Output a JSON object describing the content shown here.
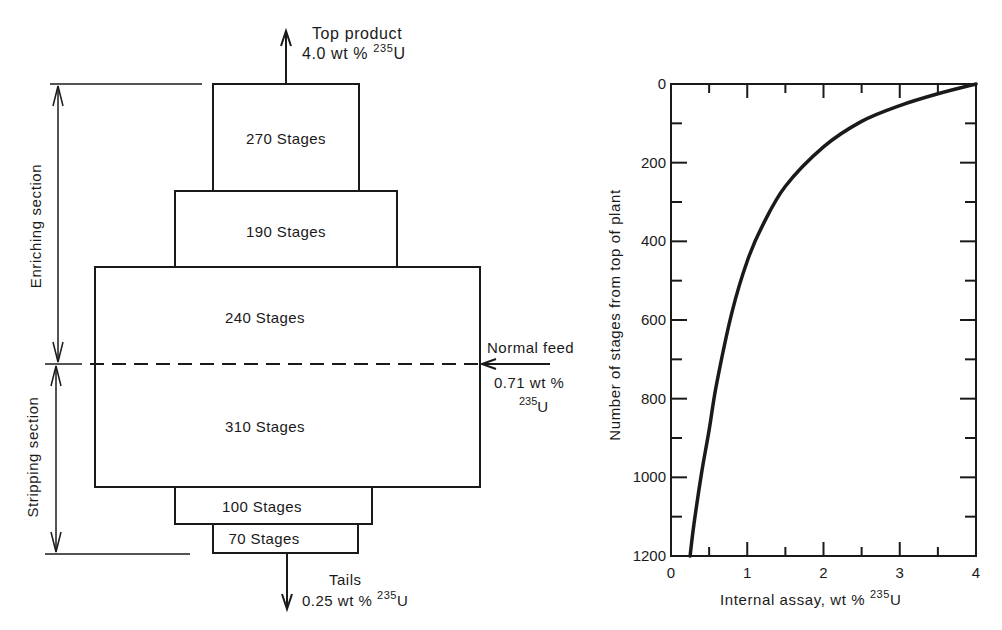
{
  "cascade": {
    "top_product": {
      "label": "Top product",
      "assay_value": "4.0 wt % ",
      "isotope_mass": "235",
      "isotope_symbol": "U"
    },
    "tails": {
      "label": "Tails",
      "assay_value": "0.25 wt % ",
      "isotope_mass": "235",
      "isotope_symbol": "U"
    },
    "normal_feed": {
      "label": "Normal feed",
      "assay_value": "0.71 wt %",
      "isotope_mass": "235",
      "isotope_symbol": "U"
    },
    "sections": [
      {
        "label": "Enriching section"
      },
      {
        "label": "Stripping section"
      }
    ],
    "blocks": [
      {
        "label": "270 Stages",
        "stages": 270
      },
      {
        "label": "190 Stages",
        "stages": 190
      },
      {
        "label": "240 Stages",
        "stages": 240
      },
      {
        "label": "310 Stages",
        "stages": 310
      },
      {
        "label": "100 Stages",
        "stages": 100
      },
      {
        "label": "70 Stages",
        "stages": 70
      }
    ]
  },
  "chart_data": {
    "type": "line",
    "title": "",
    "xlabel": "Internal assay, wt % 235U",
    "xlabel_text": "Internal assay, wt % ",
    "xlabel_isotope_mass": "235",
    "xlabel_isotope_symbol": "U",
    "ylabel": "Number of stages from top of plant",
    "xlim": [
      0,
      4
    ],
    "ylim": [
      1200,
      0
    ],
    "y_inverted": true,
    "grid": false,
    "x_ticks": [
      "0",
      "1",
      "2",
      "3",
      "4"
    ],
    "y_ticks": [
      "0",
      "200",
      "400",
      "600",
      "800",
      "1000",
      "1200"
    ],
    "series": [
      {
        "name": "Internal assay profile",
        "x": [
          4.0,
          3.5,
          3.0,
          2.5,
          2.0,
          1.5,
          1.2,
          1.0,
          0.8,
          0.6,
          0.5,
          0.4,
          0.3,
          0.25
        ],
        "y": [
          0,
          25,
          55,
          95,
          160,
          260,
          360,
          450,
          580,
          760,
          880,
          990,
          1120,
          1200
        ]
      }
    ]
  }
}
